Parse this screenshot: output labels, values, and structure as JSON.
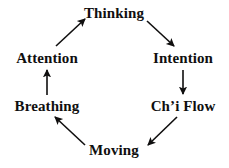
{
  "diagram": {
    "background_color": "#ffffff",
    "ink_color": "#100f0f",
    "shape": "hexagonal-cycle",
    "direction": "clockwise",
    "nodes": [
      {
        "id": "thinking",
        "label": "Thinking",
        "position": "top"
      },
      {
        "id": "intention",
        "label": "Intention",
        "position": "upper-right"
      },
      {
        "id": "chiflow",
        "label": "Ch’i Flow",
        "position": "lower-right"
      },
      {
        "id": "moving",
        "label": "Moving",
        "position": "bottom"
      },
      {
        "id": "breathing",
        "label": "Breathing",
        "position": "lower-left"
      },
      {
        "id": "attention",
        "label": "Attention",
        "position": "upper-left"
      }
    ],
    "edges": [
      {
        "id": "thinking-to-intention",
        "from": "Thinking",
        "to": "Intention",
        "style": "arrow",
        "orientation": "diagonal-down-right"
      },
      {
        "id": "intention-to-chiflow",
        "from": "Intention",
        "to": "Ch’i Flow",
        "style": "arrow",
        "orientation": "vertical-down"
      },
      {
        "id": "chiflow-to-moving",
        "from": "Ch’i Flow",
        "to": "Moving",
        "style": "arrow",
        "orientation": "diagonal-down-left"
      },
      {
        "id": "moving-to-breathing",
        "from": "Moving",
        "to": "Breathing",
        "style": "arrow",
        "orientation": "diagonal-up-left"
      },
      {
        "id": "breathing-to-attention",
        "from": "Breathing",
        "to": "Attention",
        "style": "arrow",
        "orientation": "vertical-up"
      },
      {
        "id": "attention-to-thinking",
        "from": "Attention",
        "to": "Thinking",
        "style": "arrow",
        "orientation": "diagonal-up-right"
      }
    ]
  }
}
